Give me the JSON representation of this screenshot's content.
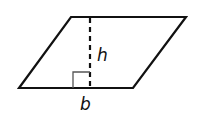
{
  "diagram": {
    "shape": "parallelogram",
    "labels": {
      "height": "h",
      "base": "b"
    },
    "vertices": {
      "top_left": [
        71,
        17
      ],
      "top_right": [
        186,
        17
      ],
      "bottom_right": [
        133,
        88
      ],
      "bottom_left": [
        19,
        88
      ]
    },
    "height_line": {
      "x": 90,
      "y1": 17,
      "y2": 88,
      "style": "dashed"
    },
    "right_angle_marker": {
      "x": 73,
      "y": 71,
      "size": 17
    },
    "colors": {
      "stroke": "#111111",
      "marker": "#555555",
      "background": "#ffffff"
    }
  }
}
